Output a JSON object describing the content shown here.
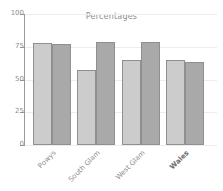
{
  "chart_data": {
    "type": "bar",
    "title": "Percentages",
    "xlabel": "",
    "ylabel": "",
    "ylim": [
      0,
      100
    ],
    "yticks": [
      0,
      25,
      50,
      75,
      100
    ],
    "ytick_labels": [
      "0",
      "25",
      "50",
      "75",
      "100"
    ],
    "grid": true,
    "legend": "none",
    "categories": [
      "Powys",
      "South Glam",
      "West Glam",
      "Wales"
    ],
    "emphasized_category": "Wales",
    "series": [
      {
        "name": "series-a",
        "color": "#cccccc",
        "values": [
          78,
          57,
          65,
          65
        ]
      },
      {
        "name": "series-b",
        "color": "#a9a9a9",
        "values": [
          77,
          79,
          79,
          63
        ]
      }
    ],
    "colors": {
      "background": "#ffffff",
      "axis": "#9a9a9a",
      "grid": "#ededed",
      "text": "#8c8c8c",
      "bar_edge": "#8f8f8f"
    }
  }
}
